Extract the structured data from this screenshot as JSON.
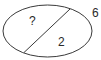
{
  "diagram": {
    "shape": "ellipse",
    "stroke_color": "#3a3a3a",
    "regions": [
      {
        "name": "upper-left",
        "label": "?"
      },
      {
        "name": "lower-right",
        "label": "2"
      }
    ],
    "outside_label": "6"
  }
}
